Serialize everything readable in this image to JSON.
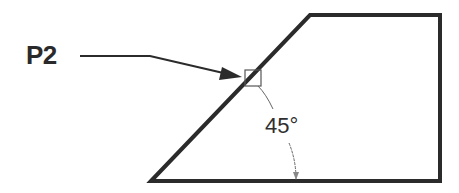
{
  "diagram": {
    "point_label": "P2",
    "angle_label": "45°",
    "shape": "trapezoid with 45-degree chamfered edge",
    "colors": {
      "stroke": "#2b2b2b",
      "annotation": "#555555",
      "background": "#ffffff"
    }
  }
}
